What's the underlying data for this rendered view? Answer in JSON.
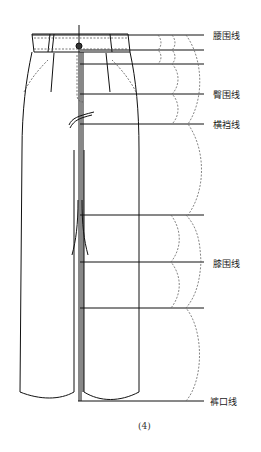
{
  "diagram": {
    "type": "trouser-measurement-lines",
    "caption": "(4)",
    "stroke_color": "#111111",
    "dash_color": "#666666",
    "labels": [
      {
        "id": "waist",
        "text": "腰围线",
        "y": 35
      },
      {
        "id": "hip",
        "text": "臀围线",
        "y": 94
      },
      {
        "id": "crotch",
        "text": "横裆线",
        "y": 124
      },
      {
        "id": "knee",
        "text": "膝围线",
        "y": 263
      },
      {
        "id": "hem",
        "text": "裤口线",
        "y": 401
      }
    ],
    "horizontal_lines_y": [
      35,
      50,
      64,
      94,
      124,
      215,
      262,
      308,
      401
    ]
  }
}
